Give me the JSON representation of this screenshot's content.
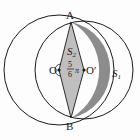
{
  "figure": {
    "type": "geometry",
    "points": {
      "A": {
        "label": "A"
      },
      "B": {
        "label": "B"
      },
      "O": {
        "label": "O"
      },
      "O_prime": {
        "label": "O′"
      }
    },
    "regions": {
      "S1": {
        "label": "S",
        "subscript": "1"
      },
      "S2": {
        "label": "S",
        "subscript": "2"
      }
    },
    "angle": {
      "numerator": "5",
      "denominator": "6",
      "symbol": "π"
    },
    "colors": {
      "stroke": "#1a1a1a",
      "shade_dark": "#8a8a8a",
      "shade_light": "#bdbdbd",
      "background": "#fdfdfd"
    }
  }
}
